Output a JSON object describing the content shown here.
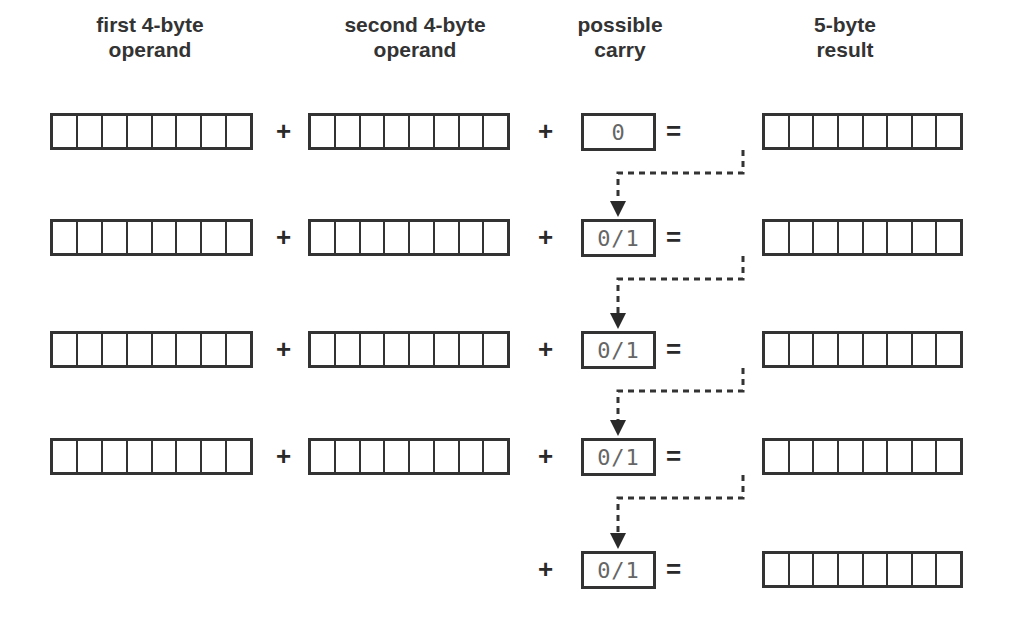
{
  "headers": {
    "first_operand": [
      "first 4-byte",
      "operand"
    ],
    "second_operand": [
      "second 4-byte",
      "operand"
    ],
    "carry": [
      "possible",
      "carry"
    ],
    "result": [
      "5-byte",
      "result"
    ]
  },
  "operators": {
    "plus": "+",
    "equals": "="
  },
  "rows": [
    {
      "has_operands": true,
      "carry": "0"
    },
    {
      "has_operands": true,
      "carry": "0/1"
    },
    {
      "has_operands": true,
      "carry": "0/1"
    },
    {
      "has_operands": true,
      "carry": "0/1"
    },
    {
      "has_operands": false,
      "carry": "0/1"
    }
  ],
  "cells_per_register": 8,
  "colors": {
    "stroke": "#333333",
    "carry_text": "#666666",
    "background": "#ffffff"
  }
}
